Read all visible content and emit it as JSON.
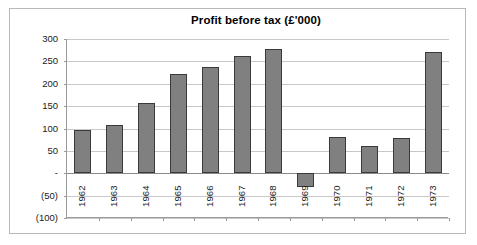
{
  "chart_data": {
    "type": "bar",
    "title": "Profit before tax (£'000)",
    "xlabel": "",
    "ylabel": "",
    "categories": [
      "1962",
      "1963",
      "1964",
      "1965",
      "1966",
      "1967",
      "1968",
      "1969",
      "1970",
      "1971",
      "1972",
      "1973"
    ],
    "values": [
      96,
      108,
      158,
      222,
      238,
      261,
      278,
      -30,
      81,
      62,
      79,
      272
    ],
    "ylim": [
      -100,
      300
    ],
    "ytick_values": [
      300,
      250,
      200,
      150,
      100,
      50,
      0,
      -50,
      -100
    ],
    "ytick_labels": [
      "300",
      "250",
      "200",
      "150",
      "100",
      "50",
      "-",
      "(50)",
      "(100)"
    ],
    "grid": true,
    "legend": false,
    "series": [
      {
        "name": "Profit before tax",
        "values": [
          96,
          108,
          158,
          222,
          238,
          261,
          278,
          -30,
          81,
          62,
          79,
          272
        ]
      }
    ],
    "colors": {
      "bar_fill": "#808080",
      "bar_border": "#3a3a3a",
      "gridline": "#c8c8c8",
      "axis": "#9a9a9a",
      "frame": "#b9b9b9",
      "background": "#ffffff",
      "text": "#1a1a1a"
    }
  }
}
